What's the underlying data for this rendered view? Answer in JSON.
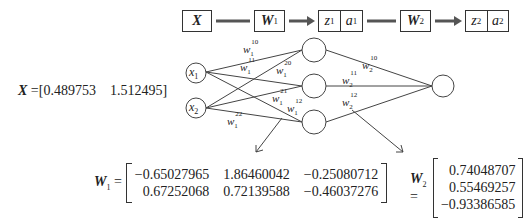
{
  "pipeline": {
    "x_label": "X",
    "w1_label": "W",
    "w1_sub": "1",
    "z1": "z",
    "z1_sub": "1",
    "a1": "a",
    "a1_sub": "1",
    "w2_label": "W",
    "w2_sub": "2",
    "z2": "z",
    "z2_sub": "2",
    "a2": "a",
    "a2_sub": "2"
  },
  "input_vector": {
    "label": "X",
    "equals": " =",
    "values": "[0.489753    1.512495]"
  },
  "network": {
    "input_nodes": [
      {
        "name": "x",
        "sub": "1"
      },
      {
        "name": "x",
        "sub": "2"
      }
    ],
    "hidden_nodes": 3,
    "output_nodes": 1,
    "weight_labels_layer1": [
      {
        "w": "w",
        "sub": "1",
        "sup": "10"
      },
      {
        "w": "w",
        "sub": "1",
        "sup": "11"
      },
      {
        "w": "w",
        "sub": "1",
        "sup": "20"
      },
      {
        "w": "w",
        "sub": "1",
        "sup": "21"
      },
      {
        "w": "w",
        "sub": "1",
        "sup": "12"
      },
      {
        "w": "w",
        "sub": "1",
        "sup": "22"
      }
    ],
    "weight_labels_layer2": [
      {
        "w": "w",
        "sub": "2",
        "sup": "10"
      },
      {
        "w": "w",
        "sub": "2",
        "sup": "11"
      },
      {
        "w": "w",
        "sub": "2",
        "sup": "12"
      }
    ]
  },
  "w1_matrix": {
    "label": "W",
    "sub": "1",
    "equals": "=",
    "rows": [
      [
        "−0.65027965",
        "1.86460042",
        "−0.25080712"
      ],
      [
        "0.67252068",
        "0.72139588",
        "−0.46037276"
      ]
    ]
  },
  "w2_matrix": {
    "label": "W",
    "sub": "2",
    "equals": "=",
    "rows": [
      [
        "0.74048707"
      ],
      [
        "0.55469257"
      ],
      [
        "−0.93386585"
      ]
    ]
  }
}
